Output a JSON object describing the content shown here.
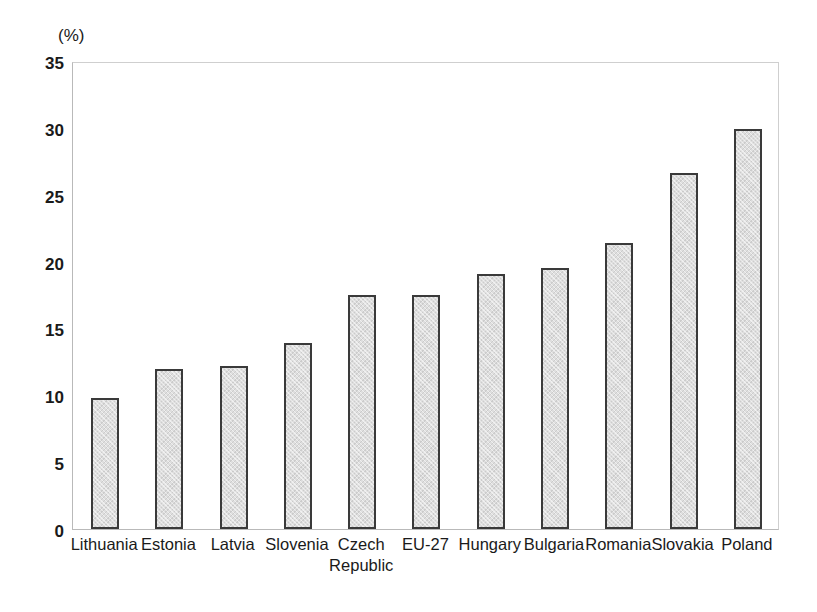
{
  "chart_data": {
    "type": "bar",
    "title": "",
    "subtitle": "",
    "xlabel": "",
    "ylabel": "",
    "unit_label": "(%)",
    "ylim": [
      0,
      35
    ],
    "ytick_step": 5,
    "yticks": [
      "35",
      "30",
      "25",
      "20",
      "15",
      "10",
      "5",
      "0"
    ],
    "grid": false,
    "legend": false,
    "categories": [
      "Lithuania",
      "Estonia",
      "Latvia",
      "Slovenia",
      "Czech Republic",
      "EU-27",
      "Hungary",
      "Bulgaria",
      "Romania",
      "Slovakia",
      "Poland"
    ],
    "category_lines": [
      [
        "Lithuania"
      ],
      [
        "Estonia"
      ],
      [
        "Latvia"
      ],
      [
        "Slovenia"
      ],
      [
        "Czech",
        "Republic"
      ],
      [
        "EU-27"
      ],
      [
        "Hungary"
      ],
      [
        "Bulgaria"
      ],
      [
        "Romania"
      ],
      [
        "Slovakia"
      ],
      [
        "Poland"
      ]
    ],
    "values": [
      9.8,
      12.0,
      12.2,
      13.9,
      17.5,
      17.5,
      19.1,
      19.5,
      21.4,
      26.6,
      29.9
    ],
    "colors": {
      "bar_fill": "#dedede",
      "bar_border": "#3a3a3a",
      "axis": "#b9b9b9",
      "text": "#1a1a1a",
      "background": "#ffffff"
    }
  }
}
